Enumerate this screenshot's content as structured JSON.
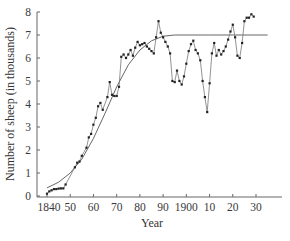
{
  "chart_data": {
    "type": "line",
    "title": "",
    "xlabel": "Year",
    "ylabel": "Number of sheep (in thousands)",
    "xlim": [
      1835,
      1938
    ],
    "ylim": [
      0,
      8
    ],
    "grid": false,
    "legend": null,
    "x_ticks": [
      1840,
      1850,
      1860,
      1870,
      1880,
      1890,
      1900,
      1910,
      1920,
      1930
    ],
    "x_tick_labels": [
      "1840",
      "50",
      "60",
      "70",
      "80",
      "90",
      "1900",
      "10",
      "20",
      "30"
    ],
    "y_ticks": [
      0,
      1,
      2,
      3,
      4,
      5,
      6,
      7,
      8
    ],
    "y_tick_labels": [
      "0",
      "1",
      "2",
      "3",
      "4",
      "5",
      "6",
      "7",
      "8"
    ],
    "series": [
      {
        "name": "Observed sheep population",
        "style": "line-with-markers",
        "x": [
          1814,
          1815,
          1816,
          1817,
          1818,
          1819,
          1820,
          1821,
          1822,
          1823
        ],
        "points": [
          [
            1840,
            0.1
          ],
          [
            1841,
            0.2
          ],
          [
            1842,
            0.25
          ],
          [
            1843,
            0.3
          ],
          [
            1844,
            0.3
          ],
          [
            1845,
            0.32
          ],
          [
            1846,
            0.33
          ],
          [
            1847,
            0.33
          ],
          [
            1848,
            0.5
          ],
          [
            1852,
            1.25
          ],
          [
            1853,
            1.45
          ],
          [
            1854,
            1.5
          ],
          [
            1855,
            1.75
          ],
          [
            1857,
            2.1
          ],
          [
            1858,
            2.55
          ],
          [
            1859,
            2.7
          ],
          [
            1860,
            3.1
          ],
          [
            1861,
            3.4
          ],
          [
            1862,
            3.9
          ],
          [
            1863,
            4.05
          ],
          [
            1864,
            3.75
          ],
          [
            1866,
            4.3
          ],
          [
            1867,
            4.95
          ],
          [
            1868,
            4.4
          ],
          [
            1869,
            4.35
          ],
          [
            1870,
            4.35
          ],
          [
            1871,
            4.75
          ],
          [
            1872,
            6.05
          ],
          [
            1873,
            6.15
          ],
          [
            1874,
            6.0
          ],
          [
            1875,
            6.15
          ],
          [
            1876,
            6.35
          ],
          [
            1877,
            6.1
          ],
          [
            1878,
            6.45
          ],
          [
            1879,
            6.7
          ],
          [
            1880,
            6.55
          ],
          [
            1881,
            6.6
          ],
          [
            1882,
            6.65
          ],
          [
            1883,
            6.5
          ],
          [
            1884,
            6.4
          ],
          [
            1885,
            6.3
          ],
          [
            1886,
            6.2
          ],
          [
            1887,
            6.9
          ],
          [
            1888,
            7.6
          ],
          [
            1889,
            7.1
          ],
          [
            1890,
            6.9
          ],
          [
            1891,
            6.7
          ],
          [
            1892,
            6.5
          ],
          [
            1893,
            6.2
          ],
          [
            1894,
            5.0
          ],
          [
            1895,
            4.95
          ],
          [
            1896,
            5.45
          ],
          [
            1897,
            5.0
          ],
          [
            1898,
            4.85
          ],
          [
            1899,
            5.2
          ],
          [
            1900,
            5.75
          ],
          [
            1901,
            6.3
          ],
          [
            1902,
            6.6
          ],
          [
            1903,
            6.75
          ],
          [
            1904,
            6.35
          ],
          [
            1905,
            6.2
          ],
          [
            1906,
            5.9
          ],
          [
            1907,
            5.0
          ],
          [
            1908,
            4.3
          ],
          [
            1909,
            3.65
          ],
          [
            1910,
            4.9
          ],
          [
            1911,
            6.2
          ],
          [
            1912,
            6.65
          ],
          [
            1913,
            6.1
          ],
          [
            1914,
            6.35
          ],
          [
            1915,
            6.15
          ],
          [
            1916,
            6.3
          ],
          [
            1917,
            6.5
          ],
          [
            1918,
            6.8
          ],
          [
            1919,
            7.15
          ],
          [
            1920,
            7.45
          ],
          [
            1921,
            6.9
          ],
          [
            1922,
            6.1
          ],
          [
            1923,
            6.0
          ],
          [
            1924,
            6.65
          ],
          [
            1925,
            7.6
          ],
          [
            1926,
            7.75
          ],
          [
            1927,
            7.75
          ],
          [
            1928,
            7.9
          ],
          [
            1929,
            7.8
          ]
        ]
      },
      {
        "name": "Logistic fit",
        "style": "smooth-curve",
        "points": [
          [
            1840,
            0.35
          ],
          [
            1845,
            0.6
          ],
          [
            1850,
            1.0
          ],
          [
            1855,
            1.6
          ],
          [
            1860,
            2.5
          ],
          [
            1865,
            3.6
          ],
          [
            1870,
            4.75
          ],
          [
            1875,
            5.7
          ],
          [
            1880,
            6.35
          ],
          [
            1885,
            6.75
          ],
          [
            1890,
            6.95
          ],
          [
            1895,
            7.0
          ],
          [
            1900,
            7.0
          ],
          [
            1910,
            7.0
          ],
          [
            1920,
            7.0
          ],
          [
            1930,
            7.0
          ],
          [
            1935,
            7.0
          ]
        ]
      }
    ],
    "annotations": []
  },
  "caption": "Year"
}
